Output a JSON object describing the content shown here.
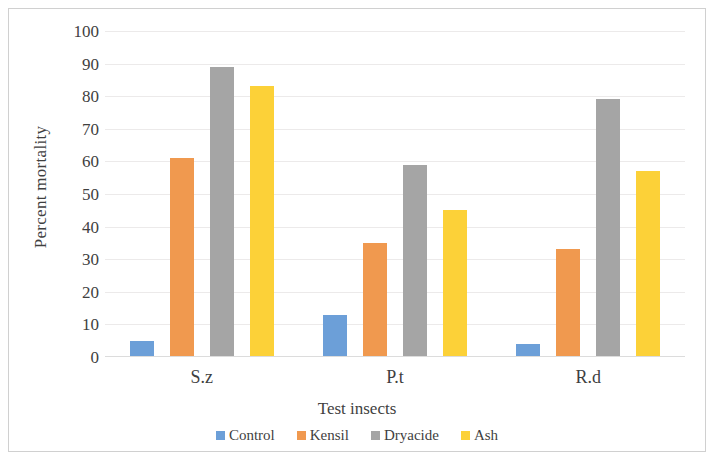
{
  "chart_data": {
    "type": "bar",
    "title": "",
    "xlabel": "Test insects",
    "ylabel": "Percent mortality",
    "categories": [
      "S.z",
      "P.t",
      "R.d"
    ],
    "series": [
      {
        "name": "Control",
        "color": "#6c9fd8",
        "values": [
          5,
          13,
          4
        ]
      },
      {
        "name": "Kensil",
        "color": "#f0994f",
        "values": [
          61,
          35,
          33
        ]
      },
      {
        "name": "Dryacide",
        "color": "#a5a5a5",
        "values": [
          89,
          59,
          79
        ]
      },
      {
        "name": "Ash",
        "color": "#fcd138",
        "values": [
          83,
          45,
          57
        ]
      }
    ],
    "ylim": [
      0,
      100
    ],
    "yticks": [
      0,
      10,
      20,
      30,
      40,
      50,
      60,
      70,
      80,
      90,
      100
    ],
    "ytick_labels": [
      "0",
      "10",
      "20",
      "30",
      "40",
      "50",
      "60",
      "70",
      "80",
      "90",
      "100"
    ],
    "grid": true,
    "legend_position": "bottom"
  },
  "axes": {
    "y_title": "Percent mortality",
    "x_title": "Test insects"
  }
}
